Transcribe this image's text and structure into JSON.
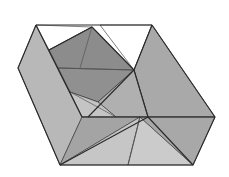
{
  "diagram": {
    "title": "",
    "colors": {
      "background": "#ffffff",
      "outline": "#2a2a2a",
      "light_facet": "#c9c9c9",
      "mid_facet": "#adadad",
      "dark_facet": "#8e8e8e",
      "opening": "#ffffff"
    },
    "facets": [
      {
        "name": "left-wall",
        "points": "36,25 18,68 60,165 82,117",
        "fill": "#b8b8b8"
      },
      {
        "name": "top-opening-left",
        "points": "36,25 92,27 49,50",
        "fill": "#ffffff"
      },
      {
        "name": "top-opening-right",
        "points": "100,25 152,25 134,70",
        "fill": "#ffffff"
      },
      {
        "name": "back-inner-dark",
        "points": "49,50 92,27 134,70 98,102 70,92",
        "fill": "#8c8c8c"
      },
      {
        "name": "back-inner-lower",
        "points": "58,68 134,70 98,102 70,92",
        "fill": "#909090"
      },
      {
        "name": "right-wall",
        "points": "152,25 215,117 148,117 134,70",
        "fill": "#a9a9a9"
      },
      {
        "name": "inner-right-slope",
        "points": "134,70 148,117 116,117 98,102",
        "fill": "#b0b0b0"
      },
      {
        "name": "inner-floor-left",
        "points": "70,92 98,102 116,117 82,117",
        "fill": "#c4c4c4"
      },
      {
        "name": "front-left-triangle",
        "points": "82,117 140,117 60,165",
        "fill": "#a4a4a4"
      },
      {
        "name": "front-middle",
        "points": "140,117 60,165 128,165",
        "fill": "#c6c6c6"
      },
      {
        "name": "front-right-tri",
        "points": "140,117 128,165 193,165",
        "fill": "#cbcbcb"
      },
      {
        "name": "front-right-wall",
        "points": "148,117 215,117 193,165 140,117",
        "fill": "#a8a8a8"
      }
    ],
    "edges": [
      {
        "name": "top-edge",
        "points": "36,25 152,25"
      },
      {
        "name": "left-outer",
        "points": "36,25 18,68 60,165 193,165 215,117 152,25"
      },
      {
        "name": "left-fold",
        "points": "36,25 82,117"
      },
      {
        "name": "mid-line",
        "points": "82,117 215,117"
      },
      {
        "name": "inner-back",
        "points": "49,50 92,27 134,70"
      },
      {
        "name": "right-fold",
        "points": "152,25 134,70"
      },
      {
        "name": "inner-diag",
        "points": "134,70 88,117"
      },
      {
        "name": "front-left-diag",
        "points": "60,165 148,117"
      },
      {
        "name": "front-right-diag",
        "points": "148,117 193,165"
      },
      {
        "name": "inner-slope",
        "points": "134,70 148,117"
      }
    ],
    "thin_lines": [
      {
        "name": "inner-horizontal",
        "points": "58,68 134,70"
      },
      {
        "name": "inner-vertical",
        "points": "92,27 80,68"
      },
      {
        "name": "front-crease",
        "points": "140,117 128,165"
      },
      {
        "name": "floor-line-a",
        "points": "70,92 116,117"
      },
      {
        "name": "floor-line-b",
        "points": "49,50 70,92"
      }
    ]
  }
}
